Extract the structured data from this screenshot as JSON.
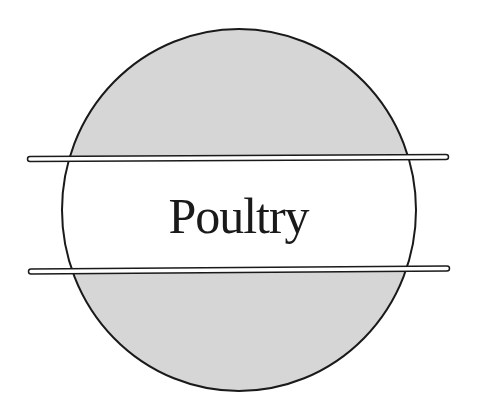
{
  "emblem": {
    "title": "Poultry",
    "colors": {
      "background": "#ffffff",
      "circle_fill": "#d6d6d6",
      "band_fill": "#ffffff",
      "outline": "#1a1a1a"
    }
  }
}
